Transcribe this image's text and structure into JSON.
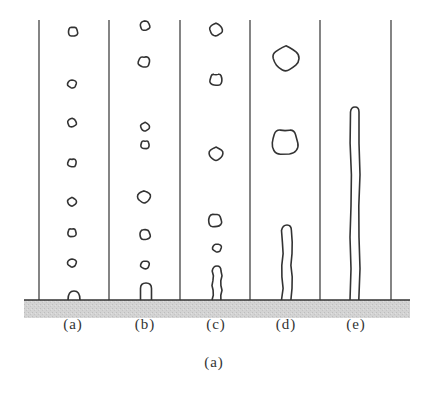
{
  "figure": {
    "caption": "(a)",
    "colors": {
      "stroke": "#333333",
      "substrate": "#cfcfcf",
      "background": "#ffffff"
    },
    "substrate": {
      "x": 24,
      "y": 300,
      "width": 386,
      "height": 18
    },
    "walls_x": [
      39,
      109,
      180,
      250,
      320,
      391
    ],
    "walls_top_y": 20,
    "baseline_y": 300,
    "columns": [
      {
        "label": "(a)",
        "center_x": 73,
        "bubbles": [
          {
            "cx": 73,
            "cy": 32,
            "r": 5
          },
          {
            "cx": 72,
            "cy": 84,
            "r": 4.5
          },
          {
            "cx": 72,
            "cy": 123,
            "r": 4.5
          },
          {
            "cx": 72,
            "cy": 163,
            "r": 4.5
          },
          {
            "cx": 72,
            "cy": 202,
            "r": 4.5
          },
          {
            "cx": 72,
            "cy": 233,
            "r": 4.5
          },
          {
            "cx": 72,
            "cy": 263,
            "r": 4.5
          }
        ],
        "attached": {
          "type": "cap",
          "cx": 74,
          "height": 9,
          "width": 12
        }
      },
      {
        "label": "(b)",
        "center_x": 145,
        "bubbles": [
          {
            "cx": 145,
            "cy": 26,
            "r": 5
          },
          {
            "cx": 144,
            "cy": 62,
            "r": 6
          },
          {
            "cx": 145,
            "cy": 127,
            "r": 4.5
          },
          {
            "cx": 145,
            "cy": 145,
            "r": 4.5
          },
          {
            "cx": 144,
            "cy": 197,
            "r": 6.5
          },
          {
            "cx": 145,
            "cy": 235,
            "r": 5.5
          },
          {
            "cx": 145,
            "cy": 265,
            "r": 4.5
          }
        ],
        "attached": {
          "type": "dome",
          "cx": 146,
          "height": 17,
          "width": 11
        }
      },
      {
        "label": "(c)",
        "center_x": 216,
        "bubbles": [
          {
            "cx": 216,
            "cy": 30,
            "r": 6.5
          },
          {
            "cx": 216,
            "cy": 80,
            "r": 6.5
          },
          {
            "cx": 216,
            "cy": 154,
            "r": 7
          },
          {
            "cx": 215,
            "cy": 221,
            "r": 7
          },
          {
            "cx": 217,
            "cy": 248,
            "r": 4.5
          }
        ],
        "attached": {
          "type": "column",
          "cx": 217,
          "height": 34,
          "width": 10
        }
      },
      {
        "label": "(d)",
        "center_x": 285,
        "bubbles": [
          {
            "cx": 286,
            "cy": 59,
            "r": 13
          },
          {
            "cx": 285,
            "cy": 143,
            "r": 14
          }
        ],
        "attached": {
          "type": "column",
          "cx": 287,
          "height": 75,
          "width": 11
        }
      },
      {
        "label": "(e)",
        "center_x": 355,
        "bubbles": [],
        "attached": {
          "type": "jet",
          "cx": 355,
          "height": 193,
          "width": 10
        }
      }
    ]
  }
}
